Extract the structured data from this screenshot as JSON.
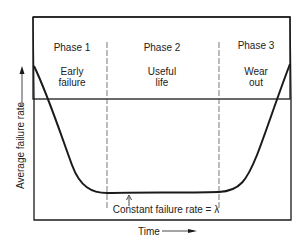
{
  "diagram": {
    "y_axis_label": "Average failure rate",
    "x_axis_label": "Time",
    "phases": [
      {
        "name": "Phase 1",
        "description_line1": "Early",
        "description_line2": "failure"
      },
      {
        "name": "Phase 2",
        "description_line1": "Useful",
        "description_line2": "life"
      },
      {
        "name": "Phase 3",
        "description_line1": "Wear",
        "description_line2": "out"
      }
    ],
    "annotation": "Constant failure rate = λ",
    "colors": {
      "line": "#1a1a1a",
      "divider": "#555555",
      "text": "#222222"
    }
  }
}
